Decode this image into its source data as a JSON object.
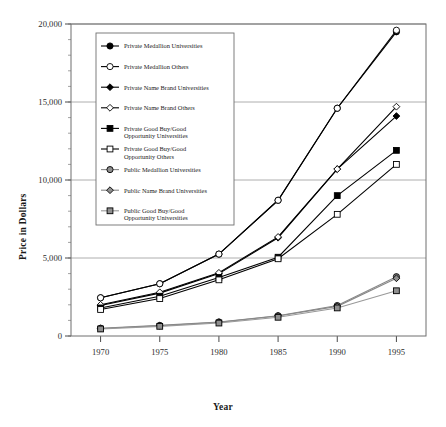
{
  "chart_data": {
    "type": "line",
    "title": "",
    "xlabel": "Year",
    "ylabel": "Price in Dollars",
    "x": [
      1970,
      1975,
      1980,
      1985,
      1990,
      1995
    ],
    "xticklabels": [
      "1970",
      "1975",
      "1980",
      "1985",
      "1990",
      "1995"
    ],
    "xlim": [
      1967.5,
      1997.5
    ],
    "ylim": [
      0,
      20000
    ],
    "yticks": [
      0,
      5000,
      10000,
      15000,
      20000
    ],
    "yticklabels": [
      "0",
      "5,000",
      "10,000",
      "15,000",
      "20,000"
    ],
    "yminor_step": 1000,
    "grid": "horizontal-major",
    "legend_position": "upper-left-inside",
    "series": [
      {
        "name": "Private Medallion Universities",
        "marker": "circle-filled",
        "color": "#000000",
        "values": [
          2450,
          3350,
          5250,
          8700,
          14600,
          19500
        ]
      },
      {
        "name": "Private Medallion Others",
        "marker": "circle-open",
        "color": "#000000",
        "values": [
          2450,
          3350,
          5250,
          8700,
          14600,
          19600
        ]
      },
      {
        "name": "Private Name Brand Universities",
        "marker": "diamond-filled",
        "color": "#000000",
        "values": [
          1950,
          2750,
          4000,
          6300,
          10700,
          14100
        ]
      },
      {
        "name": "Private Name Brand Others",
        "marker": "diamond-open",
        "color": "#000000",
        "values": [
          2000,
          2800,
          4050,
          6350,
          10700,
          14700
        ]
      },
      {
        "name": "Private Good Buy/Good Opportunity Universities",
        "marker": "square-filled",
        "color": "#000000",
        "values": [
          1800,
          2550,
          3750,
          5050,
          9000,
          11900
        ]
      },
      {
        "name": "Private Good Buy/Good Opportunity Others",
        "marker": "square-open",
        "color": "#000000",
        "values": [
          1700,
          2400,
          3600,
          4950,
          7800,
          11000
        ]
      },
      {
        "name": "Public Medallion Universities",
        "marker": "circle-gray",
        "color": "#888888",
        "values": [
          500,
          680,
          900,
          1300,
          1950,
          3800
        ]
      },
      {
        "name": "Public Name Brand Universities",
        "marker": "diamond-gray",
        "color": "#888888",
        "values": [
          480,
          660,
          880,
          1280,
          1900,
          3700
        ]
      },
      {
        "name": "Public Good Buy/Good Opportunity Universities",
        "marker": "square-gray",
        "color": "#999999",
        "values": [
          450,
          620,
          830,
          1200,
          1800,
          2900
        ]
      }
    ]
  },
  "legend": {
    "items": [
      {
        "label_line1": "Private Medallion Universities",
        "label_line2": ""
      },
      {
        "label_line1": "Private Medallion Others",
        "label_line2": ""
      },
      {
        "label_line1": "Private Name Brand Universities",
        "label_line2": ""
      },
      {
        "label_line1": "Private Name Brand Others",
        "label_line2": ""
      },
      {
        "label_line1": "Private Good Buy/Good",
        "label_line2": "Opportunity Universities"
      },
      {
        "label_line1": "Private Good Buy/Good",
        "label_line2": "Opportunity Others"
      },
      {
        "label_line1": "Public Medallion Universities",
        "label_line2": ""
      },
      {
        "label_line1": "Public Name Brand Universities",
        "label_line2": ""
      },
      {
        "label_line1": "Public Good Buy/Good",
        "label_line2": "Opportunity Universities"
      }
    ]
  },
  "axes": {
    "y_title": "Price in Dollars",
    "x_title": "Year"
  }
}
